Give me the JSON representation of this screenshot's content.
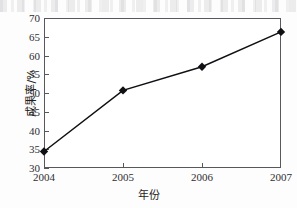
{
  "chart_data": {
    "type": "line",
    "title": "",
    "xlabel": "年份",
    "ylabel": "成果率/%",
    "categories": [
      "2004",
      "2005",
      "2006",
      "2007"
    ],
    "x": [
      2004,
      2005,
      2006,
      2007
    ],
    "values": [
      34.4,
      50.7,
      57.0,
      66.3
    ],
    "series": [
      {
        "name": "成果率/%",
        "values": [
          34.4,
          50.7,
          57.0,
          66.3
        ],
        "marker": "filled-diamond",
        "color": "#101014"
      }
    ],
    "xlim": [
      2004,
      2007
    ],
    "ylim": [
      30,
      70
    ],
    "ytick_labels": [
      "30",
      "35",
      "40",
      "45",
      "50",
      "55",
      "60",
      "65",
      "70"
    ],
    "yticks": [
      30,
      35,
      40,
      45,
      50,
      55,
      60,
      65,
      70
    ],
    "xtick_labels": [
      "2004",
      "2005",
      "2006",
      "2007"
    ],
    "grid": false,
    "legend": false,
    "legend_position": "none",
    "frame": "box",
    "tick_direction": "in",
    "line_color": "#101014",
    "axis_color": "#58585c"
  }
}
